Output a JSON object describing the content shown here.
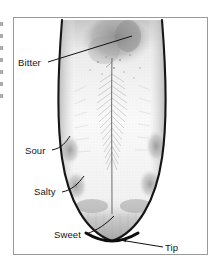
{
  "figure": {
    "frame_border_color": "#9a9a9a",
    "background_color": "#ffffff",
    "ink_color": "#151515"
  },
  "labels": {
    "bitter": "Bitter",
    "sour": "Sour",
    "salty": "Salty",
    "sweet": "Sweet",
    "tip": "Tip"
  },
  "diagram_regions": [
    {
      "name": "bitter",
      "label": "Bitter",
      "location": "posterior-dorsum"
    },
    {
      "name": "sour",
      "label": "Sour",
      "location": "lateral-posterior-margin"
    },
    {
      "name": "salty",
      "label": "Salty",
      "location": "lateral-anterior-margin"
    },
    {
      "name": "sweet",
      "label": "Sweet",
      "location": "anterior-dorsum"
    },
    {
      "name": "tip",
      "label": "Tip",
      "location": "apex"
    }
  ]
}
